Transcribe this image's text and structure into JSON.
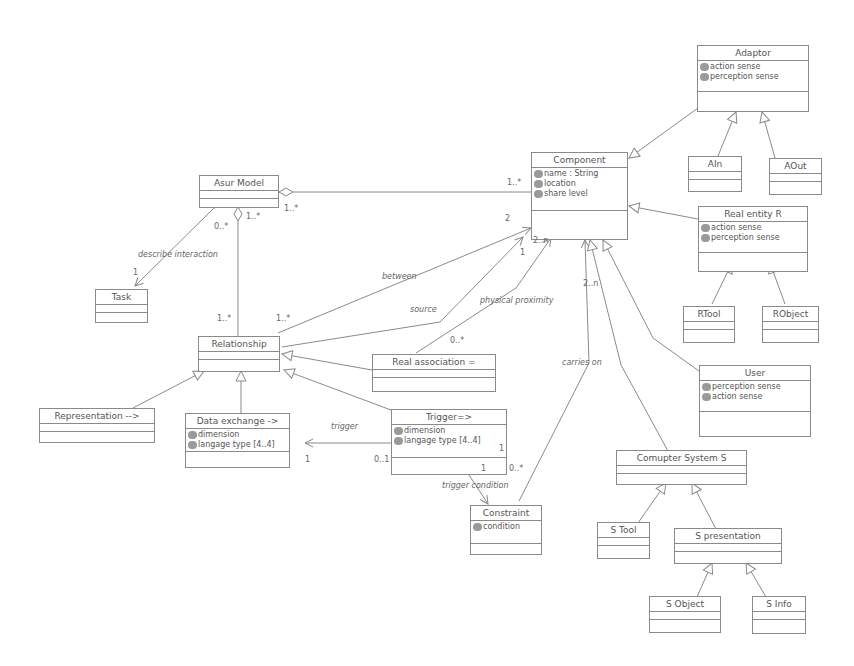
{
  "classes": {
    "asur_model": {
      "name": "Asur Model",
      "attributes": []
    },
    "task": {
      "name": "Task",
      "attributes": []
    },
    "relationship": {
      "name": "Relationship",
      "attributes": []
    },
    "representation": {
      "name": "Representation -->",
      "attributes": []
    },
    "data_exchange": {
      "name": "Data exchange ->",
      "attributes": [
        "dimension",
        "langage type [4..4]"
      ]
    },
    "trigger": {
      "name": "Trigger=>",
      "attributes": [
        "dimension",
        "langage type [4..4]"
      ]
    },
    "real_association": {
      "name": "Real association =",
      "attributes": []
    },
    "constraint": {
      "name": "Constraint",
      "attributes": [
        "condition"
      ]
    },
    "component": {
      "name": "Component",
      "attributes": [
        "name : String",
        "location",
        "share level"
      ]
    },
    "adaptor": {
      "name": "Adaptor",
      "attributes": [
        "action sense",
        "perception sense"
      ]
    },
    "ain": {
      "name": "AIn",
      "attributes": []
    },
    "aout": {
      "name": "AOut",
      "attributes": []
    },
    "real_entity": {
      "name": "Real entity R",
      "attributes": [
        "action sense",
        "perception sense"
      ]
    },
    "rtool": {
      "name": "RTool",
      "attributes": []
    },
    "robject": {
      "name": "RObject",
      "attributes": []
    },
    "user": {
      "name": "User",
      "attributes": [
        "perception sense",
        "action sense"
      ]
    },
    "computer_system": {
      "name": "Comupter System S",
      "attributes": []
    },
    "stool": {
      "name": "S Tool",
      "attributes": []
    },
    "spresentation": {
      "name": "S presentation",
      "attributes": []
    },
    "sobject": {
      "name": "S Object",
      "attributes": []
    },
    "sinfo": {
      "name": "S Info",
      "attributes": []
    }
  },
  "associations": {
    "describe_interaction": "describe interaction",
    "between": "between",
    "source": "source",
    "physical_proximity": "physical proximity",
    "carries_on": "carries on",
    "trigger": "trigger",
    "trigger_condition": "trigger condition"
  },
  "multiplicities": {
    "asur_component": "1..*",
    "asur_component_left": "1..*",
    "asur_task": "0..*",
    "asur_rel": "1..*",
    "task_one": "1",
    "rel_top": "1..*",
    "rel_between": "1..*",
    "comp_two": "2",
    "comp_2n_a": "2..n",
    "comp_one": "1",
    "real_assoc_0star": "0..*",
    "comp_2n_b": "2..n",
    "dx_one": "1",
    "trig_01": "0..1",
    "trig_one_right": "1",
    "trig_one_bottom": "1",
    "trig_0star": "0..*"
  }
}
